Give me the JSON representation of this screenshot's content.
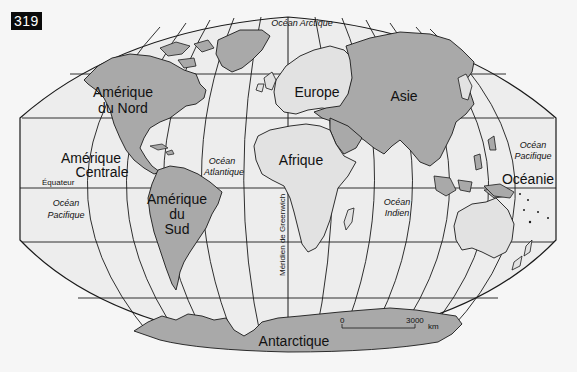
{
  "figure": {
    "number": "319"
  },
  "colors": {
    "page_background": "#f6f6f6",
    "ocean": "#ededed",
    "land_dark": "#a9a9a9",
    "land_light": "#e2e2e2",
    "lines": "#1a1a1a"
  },
  "labels": {
    "continents": {
      "north_america_1": "Amérique",
      "north_america_2": "du Nord",
      "central_america_1": "Amérique",
      "central_america_2": "Centrale",
      "south_america_1": "Amérique",
      "south_america_2": "du",
      "south_america_3": "Sud",
      "europe": "Europe",
      "asia": "Asie",
      "africa": "Afrique",
      "oceania": "Océanie",
      "antarctica": "Antarctique"
    },
    "oceans": {
      "arctic": "Océan Arctique",
      "atlantic_1": "Océan",
      "atlantic_2": "Atlantique",
      "pacific_west_1": "Océan",
      "pacific_west_2": "Pacifique",
      "pacific_east_1": "Océan",
      "pacific_east_2": "Pacifique",
      "indian_1": "Océan",
      "indian_2": "Indien"
    },
    "lines": {
      "equator": "Équateur",
      "greenwich": "Méridien de Greenwich"
    },
    "scale": {
      "start": "0",
      "end": "3000",
      "unit": "km"
    }
  }
}
